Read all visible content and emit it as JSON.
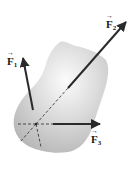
{
  "diagram": {
    "type": "free-body force diagram",
    "colors": {
      "body_light": "#f4f4f4",
      "body_dark": "#b9b9b9",
      "arrow": "#2a2a2a",
      "background": "#ffffff"
    },
    "forces": [
      {
        "id": "F1",
        "symbol": "F",
        "subscript": "1",
        "vector_hat": "→"
      },
      {
        "id": "F2",
        "symbol": "F",
        "subscript": "2",
        "vector_hat": "→"
      },
      {
        "id": "F3",
        "symbol": "F",
        "subscript": "3",
        "vector_hat": "→"
      }
    ]
  }
}
